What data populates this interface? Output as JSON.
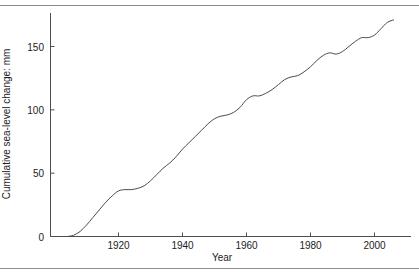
{
  "chart_data": {
    "type": "line",
    "title": "",
    "xlabel": "Year",
    "ylabel": "Cumulative sea-level change: mm",
    "xlim": [
      1903,
      2007
    ],
    "ylim": [
      -4,
      178
    ],
    "xticks": [
      1920,
      1940,
      1960,
      1980,
      2000
    ],
    "xticklabels": [
      "1920",
      "1940",
      "1960",
      "1980",
      "2000"
    ],
    "yticks": [
      0,
      50,
      100,
      150
    ],
    "yticklabels": [
      "0",
      "50",
      "100",
      "150"
    ],
    "grid": false,
    "legend": null,
    "line_color": "#4a4a4a",
    "series": [
      {
        "name": "Cumulative sea-level change",
        "x": [
          1904,
          1906,
          1908,
          1910,
          1912,
          1914,
          1916,
          1918,
          1920,
          1922,
          1924,
          1926,
          1928,
          1930,
          1932,
          1934,
          1936,
          1938,
          1940,
          1942,
          1944,
          1946,
          1948,
          1950,
          1952,
          1954,
          1956,
          1958,
          1960,
          1962,
          1964,
          1966,
          1968,
          1970,
          1972,
          1974,
          1976,
          1978,
          1980,
          1982,
          1984,
          1986,
          1988,
          1990,
          1992,
          1994,
          1996,
          1998,
          2000,
          2002,
          2004,
          2006
        ],
        "values": [
          0,
          1,
          4,
          9,
          15,
          21,
          27,
          32,
          36,
          37,
          37,
          38,
          40,
          44,
          49,
          54,
          58,
          63,
          69,
          74,
          79,
          84,
          89,
          93,
          95,
          96,
          98,
          102,
          108,
          111,
          111,
          113,
          116,
          120,
          124,
          126,
          127,
          130,
          134,
          139,
          143,
          145,
          144,
          146,
          150,
          154,
          157,
          157,
          159,
          164,
          169,
          171
        ]
      }
    ]
  },
  "axes": {
    "x_title": "Year",
    "y_title": "Cumulative sea-level change: mm"
  }
}
